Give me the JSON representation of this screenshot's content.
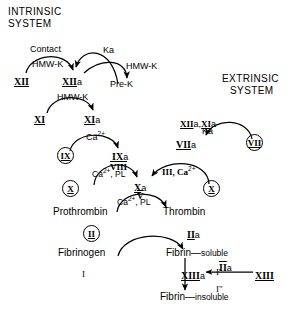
{
  "diagram": {
    "title_intrinsic": [
      "INTRINSIC",
      "SYSTEM"
    ],
    "title_extrinsic": [
      "EXTRINSIC",
      "SYSTEM"
    ],
    "type": "coagulation-cascade-flow-diagram"
  },
  "nodes": {
    "f12": {
      "roman": "XII",
      "suffix": ""
    },
    "f12a": {
      "roman": "XII",
      "suffix": "a"
    },
    "prek": {
      "text": "Pre-K"
    },
    "f11": {
      "roman": "XI",
      "suffix": ""
    },
    "f11a": {
      "roman": "XI",
      "suffix": "a"
    },
    "f9": {
      "roman": "IX",
      "suffix": ""
    },
    "f9a": {
      "roman": "IX",
      "suffix": "a"
    },
    "f10_left": {
      "roman": "X",
      "suffix": ""
    },
    "f10_right": {
      "roman": "X",
      "suffix": ""
    },
    "f10a": {
      "roman": "X",
      "suffix": "a"
    },
    "f7": {
      "roman": "VII",
      "suffix": ""
    },
    "f7a": {
      "roman": "VII",
      "suffix": "a"
    },
    "f2": {
      "roman": "II",
      "suffix": ""
    },
    "f2a": {
      "roman": "II",
      "suffix": "a"
    },
    "f13": {
      "roman": "XIII",
      "suffix": ""
    },
    "f13a": {
      "roman": "XIII",
      "suffix": "a"
    },
    "prothrombin": {
      "text": "Prothrombin"
    },
    "thrombin": {
      "text": "Thrombin"
    },
    "fibrinogen": {
      "text": "Fibrinogen"
    },
    "fibrinogen_num": {
      "roman": "I"
    },
    "fibrin_soluble": {
      "text": "Fibrin",
      "dash": "—",
      "state": "soluble",
      "num": "I'"
    },
    "fibrin_insoluble": {
      "text": "Fibrin",
      "dash": "—",
      "state": "insoluble",
      "num": "I\""
    }
  },
  "cofactors": {
    "contact": "Contact",
    "hmwk_1": "HMW-K",
    "hmwk_2": "HMW-K",
    "hmwk_3": "HMW-K",
    "ka_1": "Ka",
    "ka_2": "Ka",
    "ca_9": "Ca",
    "ca_9_sup": "2+",
    "f8_over": "VIII",
    "ca_pl_1": "Ca",
    "ca_pl_1_sup": "2+",
    "ca_pl_1_rest": ", PL",
    "f3_ca": "III, Ca",
    "f3_ca_sup": "2+",
    "f5_over": "V",
    "ca_pl_2": "Ca",
    "ca_pl_2_sup": "2+",
    "ca_pl_2_rest": ", PL",
    "xiia_xia_1": "XII",
    "xiia_xia_1s": "a,",
    "xiia_xia_2": "XI",
    "xiia_xia_2s": "a",
    "iia_activator": "II",
    "iia_activator_s": "a"
  },
  "colors": {
    "ink": "#000000",
    "background": "#ffffff"
  }
}
